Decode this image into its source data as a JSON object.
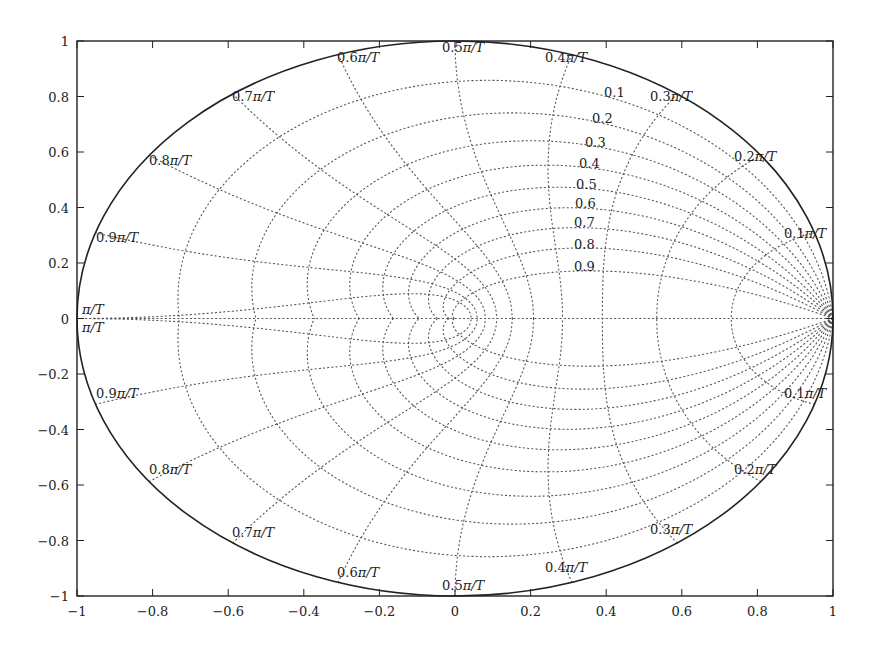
{
  "chart_data": {
    "type": "line",
    "title": "",
    "xlabel": "",
    "ylabel": "",
    "xlim": [
      -1,
      1
    ],
    "ylim": [
      -1,
      1
    ],
    "grid": false,
    "x_ticks": [
      "-1",
      "-0.8",
      "-0.6",
      "-0.4",
      "-0.2",
      "0",
      "0.2",
      "0.4",
      "0.6",
      "0.8",
      "1"
    ],
    "y_ticks": [
      "1",
      "0.8",
      "0.6",
      "0.4",
      "0.2",
      "0",
      "-0.2",
      "-0.4",
      "-0.6",
      "-0.8",
      "-1"
    ],
    "unit_circle": {
      "radius": 1,
      "style": "solid"
    },
    "damping_ratios": [
      0.1,
      0.2,
      0.3,
      0.4,
      0.5,
      0.6,
      0.7,
      0.8,
      0.9
    ],
    "damping_labels": [
      "0.1",
      "0.2",
      "0.3",
      "0.4",
      "0.5",
      "0.6",
      "0.7",
      "0.8",
      "0.9"
    ],
    "natural_frequencies_wnT": [
      0.1,
      0.2,
      0.3,
      0.4,
      0.5,
      0.6,
      0.7,
      0.8,
      0.9,
      1.0
    ],
    "frequency_labels": [
      "0.1π/T",
      "0.2π/T",
      "0.3π/T",
      "0.4π/T",
      "0.5π/T",
      "0.6π/T",
      "0.7π/T",
      "0.8π/T",
      "0.9π/T",
      "π/T"
    ],
    "line_style": "dotted"
  }
}
